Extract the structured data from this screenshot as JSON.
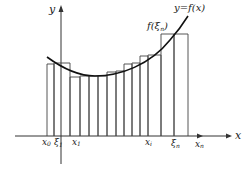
{
  "diagram": {
    "axes": {
      "x_label": "x",
      "y_label": "y"
    },
    "curve_label": "y=f(x)",
    "sample_label": "f(ξ",
    "sample_label_sub": "n",
    "sample_label_close": ")",
    "tick_labels": {
      "x0": {
        "main": "x",
        "sub": "0"
      },
      "xi1": {
        "main": "ξ",
        "sub": "1"
      },
      "x1": {
        "main": "x",
        "sub": "1"
      },
      "xi": {
        "main": "x",
        "sub": "i"
      },
      "xin": {
        "main": "ξ",
        "sub": "n"
      },
      "xn": {
        "main": "x",
        "sub": "n"
      }
    },
    "partition_x": [
      47,
      54,
      70,
      80,
      89,
      98,
      107,
      116,
      124,
      132,
      140,
      148,
      161,
      174,
      188
    ],
    "colors": {
      "line": "#333333",
      "curve": "#111111",
      "background": "#ffffff"
    }
  }
}
